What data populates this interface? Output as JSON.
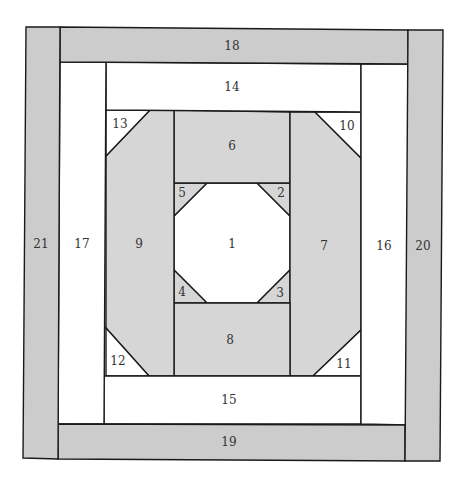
{
  "diagram": {
    "type": "foundation-paper-piecing quilt block",
    "colors": {
      "outer_grey": "#cccccc",
      "inner_grey": "#d6d6d6",
      "white": "#ffffff",
      "line": "#1a1a1a",
      "label": "#333333"
    },
    "pieces": [
      {
        "id": "1",
        "label": "1",
        "fill": "white",
        "points": "207,183 257,183 290,216 290,270 257,303 207,303 174,270 174,216",
        "lx": 232,
        "ly": 244
      },
      {
        "id": "2",
        "label": "2",
        "fill": "inner_grey",
        "points": "257,183 290,183 290,216",
        "lx": 281,
        "ly": 193
      },
      {
        "id": "3",
        "label": "3",
        "fill": "inner_grey",
        "points": "290,270 290,303 257,303",
        "lx": 280,
        "ly": 293
      },
      {
        "id": "4",
        "label": "4",
        "fill": "inner_grey",
        "points": "174,270 207,303 174,303",
        "lx": 182,
        "ly": 292
      },
      {
        "id": "5",
        "label": "5",
        "fill": "inner_grey",
        "points": "174,183 207,183 174,216",
        "lx": 182,
        "ly": 193
      },
      {
        "id": "6",
        "label": "6",
        "fill": "inner_grey",
        "points": "174,110 290,112 290,183 174,183",
        "lx": 232,
        "ly": 146
      },
      {
        "id": "7",
        "label": "7",
        "fill": "inner_grey",
        "points": "290,112 315,112 361,158 361,330 313,376 290,376",
        "lx": 324,
        "ly": 246
      },
      {
        "id": "8",
        "label": "8",
        "fill": "inner_grey",
        "points": "174,303 290,303 290,376 174,376",
        "lx": 230,
        "ly": 340
      },
      {
        "id": "9",
        "label": "9",
        "fill": "inner_grey",
        "points": "150,110 174,110 174,376 149,376 106,328 106,156",
        "lx": 139,
        "ly": 244
      },
      {
        "id": "10",
        "label": "10",
        "fill": "white",
        "points": "315,112 361,112 361,158",
        "lx": 347,
        "ly": 126
      },
      {
        "id": "11",
        "label": "11",
        "fill": "white",
        "points": "361,330 361,376 313,376",
        "lx": 344,
        "ly": 364
      },
      {
        "id": "12",
        "label": "12",
        "fill": "white",
        "points": "106,328 149,376 106,376",
        "lx": 118,
        "ly": 361
      },
      {
        "id": "13",
        "label": "13",
        "fill": "white",
        "points": "106,110 150,110 106,156",
        "lx": 120,
        "ly": 124
      },
      {
        "id": "14",
        "label": "14",
        "fill": "white",
        "points": "106,62 361,64 361,112 106,110",
        "lx": 232,
        "ly": 87
      },
      {
        "id": "15",
        "label": "15",
        "fill": "white",
        "points": "104,376 361,376 361,424 104,424",
        "lx": 229,
        "ly": 400
      },
      {
        "id": "16",
        "label": "16",
        "fill": "white",
        "points": "361,64 408,64 408,425 361,424",
        "lx": 384,
        "ly": 246
      },
      {
        "id": "17",
        "label": "17",
        "fill": "white",
        "points": "60,62 106,62 104,424 58,424",
        "lx": 82,
        "ly": 244
      },
      {
        "id": "18",
        "label": "18",
        "fill": "outer_grey",
        "points": "60,27 408,30 408,64 60,62",
        "lx": 232,
        "ly": 46
      },
      {
        "id": "19",
        "label": "19",
        "fill": "outer_grey",
        "points": "58,424 405,425 405,461 58,459",
        "lx": 229,
        "ly": 442
      },
      {
        "id": "20",
        "label": "20",
        "fill": "outer_grey",
        "points": "408,30 443,30 440,461 405,461",
        "lx": 423,
        "ly": 246
      },
      {
        "id": "21",
        "label": "21",
        "fill": "outer_grey",
        "points": "26,27 60,27 58,459 23,458",
        "lx": 41,
        "ly": 244
      }
    ]
  }
}
